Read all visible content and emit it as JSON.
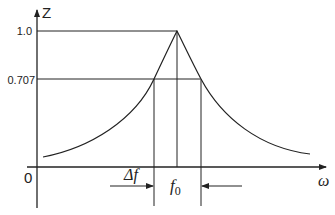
{
  "diagram": {
    "type": "resonance-curve",
    "y_axis": {
      "label": "Z",
      "ticks": [
        {
          "value": "1.0"
        },
        {
          "value": "0.707"
        }
      ]
    },
    "x_axis": {
      "label": "ω",
      "origin": "0"
    },
    "annotations": {
      "bandwidth": "Δf",
      "center_freq": "f",
      "center_sub": "0"
    },
    "colors": {
      "line": "#222222",
      "background": "#ffffff"
    }
  }
}
